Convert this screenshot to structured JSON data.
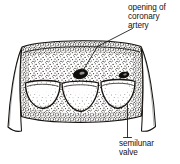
{
  "figure": {
    "style": "black-and-white stippled anatomical line engraving",
    "background_color": "#ffffff",
    "ink_color": "#15120f",
    "labels": [
      {
        "id": "coronary",
        "name": "opening-of-coronary-artery-label",
        "lines": [
          "opening of",
          "coronary",
          "artery"
        ],
        "leader": "diagonal line from label down-left to the dark oval ostium on the vessel wall"
      },
      {
        "id": "semilunar",
        "name": "semilunar-valve-label",
        "lines": [
          "semilunar",
          "valve"
        ],
        "leader": "vertical line from label up to the right-hand valve cusp"
      }
    ],
    "structures": [
      {
        "name": "vessel-wall",
        "description": "stippled cylindrical artery wall opened out flat"
      },
      {
        "name": "cut-flap-left",
        "description": "white triangular cut edge of vessel wall at left"
      },
      {
        "name": "cut-flap-right",
        "description": "white triangular cut edge of vessel wall at right"
      },
      {
        "name": "valve-cusp-left",
        "description": "pocket-shaped semilunar cusp with pale lunule"
      },
      {
        "name": "valve-cusp-center",
        "description": "pocket-shaped semilunar cusp with pale lunule"
      },
      {
        "name": "valve-cusp-right",
        "description": "pocket-shaped semilunar cusp with pale lunule"
      },
      {
        "name": "coronary-ostium",
        "description": "dark oval opening in the sinus above the cusps"
      }
    ]
  }
}
